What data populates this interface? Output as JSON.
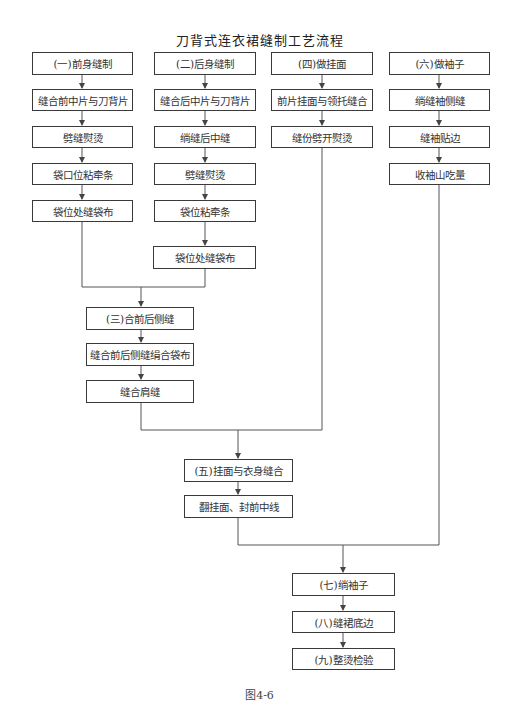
{
  "title": "刀背式连衣裙缝制工艺流程",
  "caption": "图4-6",
  "colors": {
    "line": "#555555",
    "border": "#3a3a3a",
    "text": "#333333"
  },
  "columns": {
    "front": {
      "header": "(一)前身缝制",
      "steps": [
        "缝合前中片与刀背片",
        "劈缝熨烫",
        "袋口位粘牵条",
        "袋位处缝袋布"
      ]
    },
    "back": {
      "header": "(二)后身缝制",
      "steps": [
        "缝合后中片与刀背片",
        "绱缝后中缝",
        "劈缝熨烫",
        "袋位粘牵条",
        "袋位处缝袋布"
      ]
    },
    "facing": {
      "header": "(四)做挂面",
      "steps": [
        "前片挂面与领托缝合",
        "缝份劈开熨烫"
      ]
    },
    "sleeve": {
      "header": "(六)做袖子",
      "steps": [
        "绱缝袖侧缝",
        "缝袖贴边",
        "收袖山吃量"
      ]
    }
  },
  "merge1": {
    "header": "(三)合前后侧缝",
    "steps": [
      "缝合前后侧缝绢合袋布",
      "缝合肩缝"
    ]
  },
  "merge2": {
    "header": "(五)挂面与衣身缝合",
    "steps": [
      "翻挂面、封前中线"
    ]
  },
  "final": {
    "steps": [
      "(七)绱袖子",
      "(八)缝裙底边",
      "(九)整烫检验"
    ]
  }
}
